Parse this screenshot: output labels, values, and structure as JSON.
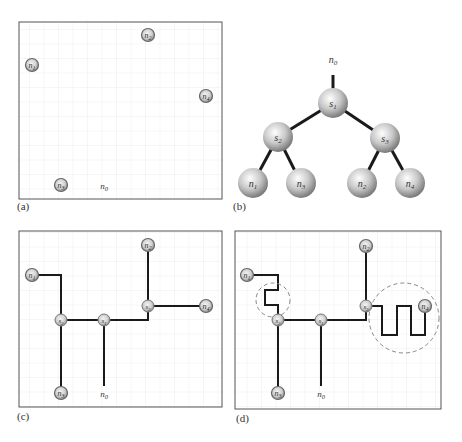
{
  "figure": {
    "panels": [
      {
        "id": "a",
        "label": "(a)",
        "description": "Pin placement on grid",
        "nodes": [
          {
            "name": "n1",
            "x": 32,
            "y": 65
          },
          {
            "name": "n2",
            "x": 148,
            "y": 35
          },
          {
            "name": "n3",
            "x": 61,
            "y": 185
          },
          {
            "name": "n4",
            "x": 206,
            "y": 96
          }
        ],
        "source": {
          "name": "n0",
          "x": 104,
          "y": 185
        }
      },
      {
        "id": "b",
        "label": "(b)",
        "description": "Clock tree topology",
        "root": "n0",
        "tree": [
          {
            "name": "s1",
            "children": [
              "s2",
              "s3"
            ]
          },
          {
            "name": "s2",
            "children": [
              "n1",
              "n3"
            ]
          },
          {
            "name": "s3",
            "children": [
              "n2",
              "n4"
            ]
          }
        ]
      },
      {
        "id": "c",
        "label": "(c)",
        "description": "Routed tree (unbalanced)"
      },
      {
        "id": "d",
        "label": "(d)",
        "description": "Routed tree with snaking wires for skew balancing"
      }
    ],
    "text": {
      "n0": "n",
      "n0_sub": "0",
      "n1": "n",
      "n1_sub": "1",
      "n2": "n",
      "n2_sub": "2",
      "n3": "n",
      "n3_sub": "3",
      "n4": "n",
      "n4_sub": "4",
      "s1": "s",
      "s1_sub": "1",
      "s2": "s",
      "s2_sub": "2",
      "s3": "s",
      "s3_sub": "3"
    },
    "colors": {
      "grid": "#e8e8e8",
      "frame": "#555555",
      "wire": "#1a1a1a",
      "dashed": "#888888"
    }
  }
}
